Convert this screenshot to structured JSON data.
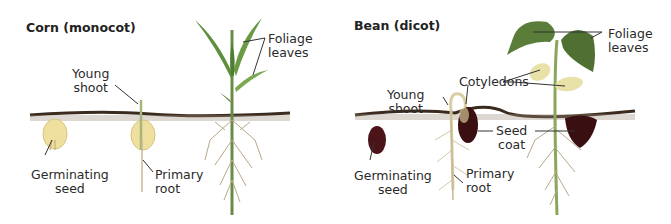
{
  "diagram": {
    "panels": [
      {
        "title": "Corn (monocot)",
        "labels": {
          "young_shoot": [
            "Young",
            "shoot"
          ],
          "foliage_leaves": [
            "Foliage",
            "leaves"
          ],
          "germinating_seed": [
            "Germinating",
            "seed"
          ],
          "primary_root": [
            "Primary",
            "root"
          ]
        }
      },
      {
        "title": "Bean (dicot)",
        "labels": {
          "foliage_leaves": [
            "Foliage",
            "leaves"
          ],
          "cotyledons": [
            "Cotyledons"
          ],
          "young_shoot": [
            "Young",
            "shoot"
          ],
          "seed_coat": [
            "Seed",
            "coat"
          ],
          "germinating_seed": [
            "Germinating",
            "seed"
          ],
          "primary_root": [
            "Primary",
            "root"
          ]
        }
      }
    ],
    "colors": {
      "soil": "#3b2a1e",
      "leaf": "#5f8f3c",
      "leaf_light": "#8fb85a",
      "corn_seed": "#f0e0a0",
      "bean_seed": "#4a1418",
      "cotyledon": "#e8e2a8",
      "root": "#b8a98a",
      "leader_line": "#333333"
    }
  }
}
